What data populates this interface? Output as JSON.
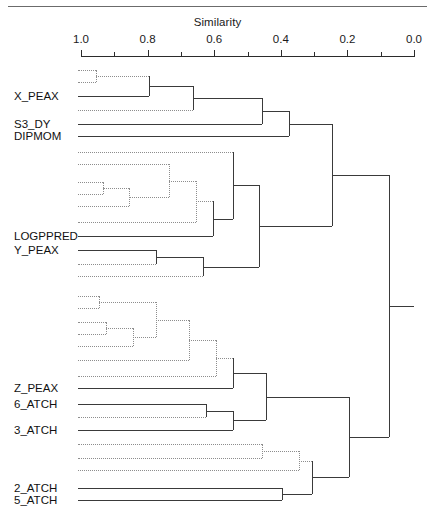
{
  "figure": {
    "axis_title": "Similarity",
    "top_rule": true
  },
  "chart_data": {
    "type": "dendrogram",
    "title": "Similarity",
    "xlabel": "Similarity",
    "ylabel": "",
    "axis_direction": "reversed",
    "xlim": [
      1.0,
      0.0
    ],
    "tick_labels": [
      "1.0",
      "0.8",
      "0.6",
      "0.4",
      "0.2",
      "0.0"
    ],
    "tick_values": [
      1.0,
      0.8,
      0.6,
      0.4,
      0.2,
      0.0
    ],
    "minor_tick_values": [
      0.9,
      0.7,
      0.5,
      0.3,
      0.1
    ],
    "grid": false,
    "legend": "none",
    "leaf_labels": [
      "X_PEAX",
      "S3_DY",
      "DIPMOM",
      "LOGPPRED",
      "Y_PEAX",
      "Z_PEAX",
      "6_ATCH",
      "3_ATCH",
      "2_ATCH",
      "5_ATCH"
    ],
    "leaves": [
      {
        "id": "L1",
        "label": "",
        "style": "dotted",
        "y": 70
      },
      {
        "id": "L2",
        "label": "",
        "style": "dotted",
        "y": 82
      },
      {
        "id": "L3",
        "label": "X_PEAX",
        "style": "solid",
        "y": 96
      },
      {
        "id": "L4",
        "label": "",
        "style": "dotted",
        "y": 110
      },
      {
        "id": "L5",
        "label": "S3_DY",
        "style": "solid",
        "y": 124
      },
      {
        "id": "L6",
        "label": "DIPMOM",
        "style": "solid",
        "y": 136
      },
      {
        "id": "L7",
        "label": "",
        "style": "dotted",
        "y": 152
      },
      {
        "id": "L8",
        "label": "",
        "style": "dotted",
        "y": 164
      },
      {
        "id": "L9",
        "label": "",
        "style": "dotted",
        "y": 182
      },
      {
        "id": "L10",
        "label": "",
        "style": "dotted",
        "y": 194
      },
      {
        "id": "L11",
        "label": "",
        "style": "dotted",
        "y": 206
      },
      {
        "id": "L12",
        "label": "",
        "style": "dotted",
        "y": 222
      },
      {
        "id": "L13",
        "label": "LOGPPRED",
        "style": "solid",
        "y": 236
      },
      {
        "id": "L14",
        "label": "Y_PEAX",
        "style": "solid",
        "y": 250
      },
      {
        "id": "L15",
        "label": "",
        "style": "dotted",
        "y": 264
      },
      {
        "id": "L16",
        "label": "",
        "style": "dotted",
        "y": 276
      },
      {
        "id": "L17",
        "label": "",
        "style": "dotted",
        "y": 296
      },
      {
        "id": "L18",
        "label": "",
        "style": "dotted",
        "y": 308
      },
      {
        "id": "L19",
        "label": "",
        "style": "dotted",
        "y": 322
      },
      {
        "id": "L20",
        "label": "",
        "style": "dotted",
        "y": 334
      },
      {
        "id": "L21",
        "label": "",
        "style": "dotted",
        "y": 346
      },
      {
        "id": "L22",
        "label": "",
        "style": "dotted",
        "y": 360
      },
      {
        "id": "L23",
        "label": "",
        "style": "dotted",
        "y": 376
      },
      {
        "id": "L24",
        "label": "Z_PEAX",
        "style": "solid",
        "y": 388
      },
      {
        "id": "L25",
        "label": "6_ATCH",
        "style": "solid",
        "y": 404
      },
      {
        "id": "L26",
        "label": "",
        "style": "dotted",
        "y": 417
      },
      {
        "id": "L27",
        "label": "3_ATCH",
        "style": "solid",
        "y": 430
      },
      {
        "id": "L28",
        "label": "",
        "style": "dotted",
        "y": 444
      },
      {
        "id": "L29",
        "label": "",
        "style": "dotted",
        "y": 458
      },
      {
        "id": "L30",
        "label": "",
        "style": "dotted",
        "y": 470
      },
      {
        "id": "L31",
        "label": "2_ATCH",
        "style": "solid",
        "y": 488
      },
      {
        "id": "L32",
        "label": "5_ATCH",
        "style": "solid",
        "y": 500
      }
    ],
    "merges": [
      {
        "id": "M1",
        "children": [
          "L1",
          "L2"
        ],
        "similarity": 0.955,
        "style": "dotted"
      },
      {
        "id": "M2",
        "children": [
          "M1",
          "L3"
        ],
        "similarity": 0.795,
        "style": "mixed"
      },
      {
        "id": "M3",
        "children": [
          "M2",
          "L4"
        ],
        "similarity": 0.665,
        "style": "mixed"
      },
      {
        "id": "M4",
        "children": [
          "M3",
          "L5"
        ],
        "similarity": 0.455,
        "style": "solid"
      },
      {
        "id": "M5",
        "children": [
          "M4",
          "L6"
        ],
        "similarity": 0.375,
        "style": "solid"
      },
      {
        "id": "M6",
        "children": [
          "L9",
          "L10"
        ],
        "similarity": 0.935,
        "style": "dotted"
      },
      {
        "id": "M7",
        "children": [
          "M6",
          "L11"
        ],
        "similarity": 0.855,
        "style": "dotted"
      },
      {
        "id": "M8",
        "children": [
          "M7",
          "L8"
        ],
        "similarity": 0.735,
        "style": "dotted"
      },
      {
        "id": "M9",
        "children": [
          "M8",
          "L12"
        ],
        "similarity": 0.655,
        "style": "dotted"
      },
      {
        "id": "M10",
        "children": [
          "M9",
          "L13"
        ],
        "similarity": 0.605,
        "style": "mixed"
      },
      {
        "id": "M11",
        "children": [
          "M10",
          "L7"
        ],
        "similarity": 0.545,
        "style": "mixed"
      },
      {
        "id": "M12",
        "children": [
          "L14",
          "L15"
        ],
        "similarity": 0.775,
        "style": "mixed"
      },
      {
        "id": "M13",
        "children": [
          "M12",
          "L16"
        ],
        "similarity": 0.635,
        "style": "mixed"
      },
      {
        "id": "M14",
        "children": [
          "M11",
          "M13"
        ],
        "similarity": 0.465,
        "style": "solid"
      },
      {
        "id": "M15",
        "children": [
          "M5",
          "M14"
        ],
        "similarity": 0.245,
        "style": "solid"
      },
      {
        "id": "M16",
        "children": [
          "L17",
          "L18"
        ],
        "similarity": 0.945,
        "style": "dotted"
      },
      {
        "id": "M17",
        "children": [
          "L19",
          "L20"
        ],
        "similarity": 0.925,
        "style": "dotted"
      },
      {
        "id": "M18",
        "children": [
          "M17",
          "L21"
        ],
        "similarity": 0.845,
        "style": "dotted"
      },
      {
        "id": "M19",
        "children": [
          "M16",
          "M18"
        ],
        "similarity": 0.775,
        "style": "dotted"
      },
      {
        "id": "M20",
        "children": [
          "M19",
          "L22"
        ],
        "similarity": 0.675,
        "style": "dotted"
      },
      {
        "id": "M21",
        "children": [
          "M20",
          "L23"
        ],
        "similarity": 0.595,
        "style": "dotted"
      },
      {
        "id": "M22",
        "children": [
          "M21",
          "L24"
        ],
        "similarity": 0.545,
        "style": "mixed"
      },
      {
        "id": "M23",
        "children": [
          "L25",
          "L26"
        ],
        "similarity": 0.625,
        "style": "mixed"
      },
      {
        "id": "M24",
        "children": [
          "M23",
          "L27"
        ],
        "similarity": 0.545,
        "style": "mixed"
      },
      {
        "id": "M25",
        "children": [
          "M22",
          "M24"
        ],
        "similarity": 0.445,
        "style": "solid"
      },
      {
        "id": "M26",
        "children": [
          "L28",
          "L29"
        ],
        "similarity": 0.455,
        "style": "dotted"
      },
      {
        "id": "M27",
        "children": [
          "M26",
          "L30"
        ],
        "similarity": 0.345,
        "style": "dotted"
      },
      {
        "id": "M28",
        "children": [
          "L31",
          "L32"
        ],
        "similarity": 0.395,
        "style": "solid"
      },
      {
        "id": "M29",
        "children": [
          "M27",
          "M28"
        ],
        "similarity": 0.305,
        "style": "mixed"
      },
      {
        "id": "M30",
        "children": [
          "M25",
          "M29"
        ],
        "similarity": 0.195,
        "style": "solid"
      },
      {
        "id": "M31",
        "children": [
          "M15",
          "M30"
        ],
        "similarity": 0.075,
        "style": "solid"
      }
    ],
    "geometry": {
      "x_at_similarity_1": 81,
      "x_at_similarity_0": 414,
      "leaf_start_x": 78,
      "axis_y": 56
    }
  }
}
